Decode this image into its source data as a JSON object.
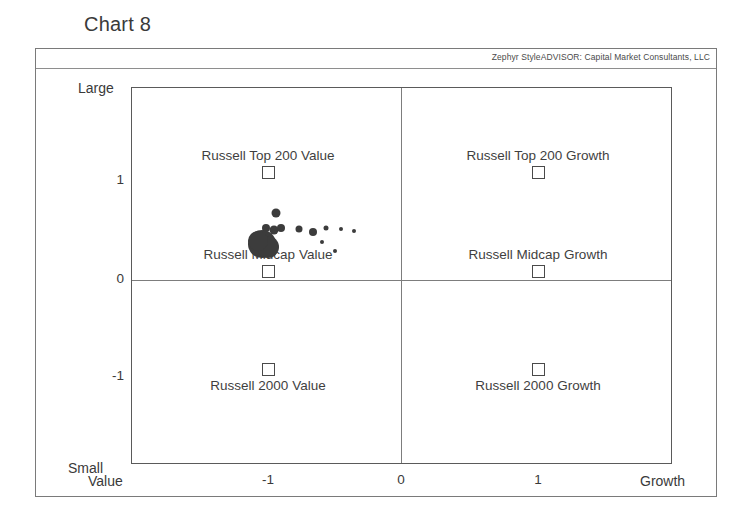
{
  "chart": {
    "title": "Chart 8",
    "header_credit": "Zephyr StyleADVISOR: Capital Market Consultants, LLC"
  },
  "axes": {
    "y_top_label": "Large",
    "y_bottom_label": "Small",
    "x_left_label": "Value",
    "x_right_label": "Growth",
    "y_ticks": [
      "1",
      "0",
      "-1"
    ],
    "x_ticks": [
      "-1",
      "0",
      "1"
    ]
  },
  "benchmarks": [
    {
      "label": "Russell Top 200 Value",
      "x": -1,
      "y": 1,
      "label_position": "above"
    },
    {
      "label": "Russell Top 200 Growth",
      "x": 1,
      "y": 1,
      "label_position": "above"
    },
    {
      "label": "Russell Midcap Value",
      "x": -1,
      "y": 0,
      "label_position": "above"
    },
    {
      "label": "Russell Midcap Growth",
      "x": 1,
      "y": 0,
      "label_position": "above"
    },
    {
      "label": "Russell 2000 Value",
      "x": -1,
      "y": -1,
      "label_position": "below"
    },
    {
      "label": "Russell 2000 Growth",
      "x": 1,
      "y": -1,
      "label_position": "below"
    }
  ],
  "chart_data": {
    "type": "scatter",
    "title": "Chart 8",
    "xlabel": "Value — Growth",
    "ylabel": "Small — Large",
    "xlim": [
      -1.96,
      2.0
    ],
    "ylim": [
      -1.96,
      1.97
    ],
    "grid": true,
    "legend": "none",
    "marker_color": "#3c3c3c",
    "axis_tick_values_x": [
      -1,
      0,
      1
    ],
    "axis_tick_values_y": [
      -1,
      0,
      1
    ],
    "points": [
      {
        "x": -0.9,
        "y": 0.66,
        "size": 9
      },
      {
        "x": -0.97,
        "y": 0.5,
        "size": 8
      },
      {
        "x": -0.91,
        "y": 0.48,
        "size": 9
      },
      {
        "x": -0.86,
        "y": 0.5,
        "size": 8
      },
      {
        "x": -1.0,
        "y": 0.33,
        "size": 28
      },
      {
        "x": -0.96,
        "y": 0.3,
        "size": 22
      },
      {
        "x": -1.03,
        "y": 0.36,
        "size": 20
      },
      {
        "x": -0.73,
        "y": 0.49,
        "size": 7
      },
      {
        "x": -0.63,
        "y": 0.46,
        "size": 8
      },
      {
        "x": -0.53,
        "y": 0.5,
        "size": 5
      },
      {
        "x": -0.56,
        "y": 0.35,
        "size": 4
      },
      {
        "x": -0.42,
        "y": 0.49,
        "size": 4
      },
      {
        "x": -0.33,
        "y": 0.47,
        "size": 4
      },
      {
        "x": -0.47,
        "y": 0.26,
        "size": 4
      }
    ]
  }
}
